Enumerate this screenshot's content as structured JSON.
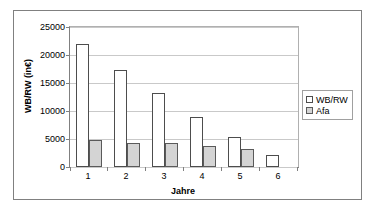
{
  "chart_data": {
    "type": "bar",
    "title": "",
    "xlabel": "Jahre",
    "ylabel": "WB/RW (in€)",
    "categories": [
      "1",
      "2",
      "3",
      "4",
      "5",
      "6"
    ],
    "series": [
      {
        "name": "WB/RW",
        "values": [
          22000,
          17300,
          13300,
          8900,
          5300,
          2200
        ],
        "color": "#ffffff"
      },
      {
        "name": "Afa",
        "values": [
          4900,
          4200,
          4200,
          3700,
          3300,
          null
        ],
        "color": "#d4d4d4"
      }
    ],
    "ylim": [
      0,
      25000
    ],
    "yticks": [
      0,
      5000,
      10000,
      15000,
      20000,
      25000
    ],
    "ytick_labels": [
      "0",
      "5000",
      "10000",
      "15000",
      "20000",
      "25000"
    ],
    "grid": true,
    "legend_position": "right"
  },
  "legend": {
    "items": [
      {
        "label": "WB/RW"
      },
      {
        "label": "Afa"
      }
    ]
  },
  "colors": {
    "frame_border": "#808080",
    "gridline": "#c9c9c9",
    "bar_wb_fill": "#ffffff",
    "bar_wb_stroke": "#4d4d4d",
    "bar_afa_fill": "#d4d4d4",
    "bar_afa_stroke": "#5a5a5a"
  }
}
